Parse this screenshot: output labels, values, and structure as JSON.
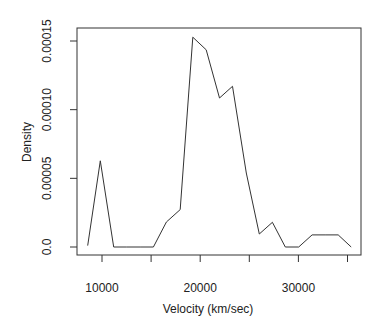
{
  "chart_data": {
    "type": "line",
    "title": "",
    "xlabel": "Velocity (km/sec)",
    "ylabel": "Density",
    "xlim": [
      7900,
      36000
    ],
    "ylim": [
      -5e-06,
      0.000158
    ],
    "grid": false,
    "legend": null,
    "x_ticks": [
      10000,
      15000,
      20000,
      25000,
      30000,
      35000
    ],
    "x_tick_labels": [
      "10000",
      "",
      "20000",
      "",
      "30000",
      ""
    ],
    "y_ticks": [
      0,
      5e-05,
      0.0001,
      0.00015
    ],
    "y_tick_labels": [
      "0.0",
      "0.00005",
      "0.00010",
      "0.00015"
    ],
    "series": [
      {
        "name": "density",
        "x": [
          8540,
          9830,
          11190,
          12530,
          13880,
          15230,
          16560,
          17960,
          19250,
          20610,
          21970,
          23290,
          24690,
          26020,
          27350,
          28670,
          30030,
          31400,
          32720,
          34050,
          35380
        ],
        "y": [
          1e-06,
          6.28e-05,
          0,
          0,
          0,
          0,
          1.82e-05,
          2.72e-05,
          0.0001528,
          0.0001436,
          0.0001085,
          0.000117,
          5.39e-05,
          9.5e-06,
          1.8e-05,
          0,
          0,
          8.8e-06,
          8.8e-06,
          8.8e-06,
          0
        ]
      }
    ]
  },
  "labels": {
    "xlabel": "Velocity (km/sec)",
    "ylabel": "Density"
  }
}
